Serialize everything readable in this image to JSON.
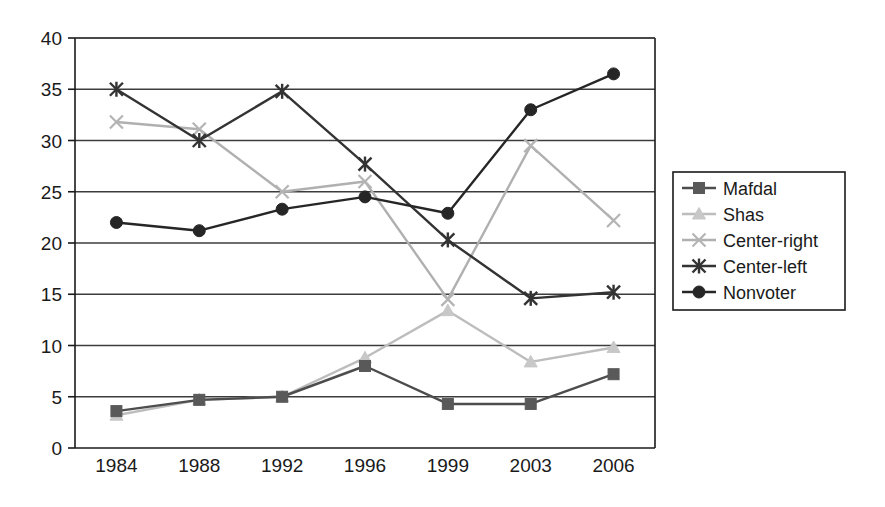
{
  "chart_data": {
    "type": "line",
    "title": "",
    "subtitle": "",
    "xlabel": "",
    "ylabel": "",
    "categories": [
      "1984",
      "1988",
      "1992",
      "1996",
      "1999",
      "2003",
      "2006"
    ],
    "x_tick_labels": [
      "1984",
      "1988",
      "1992",
      "1996",
      "1999",
      "2003",
      "2006"
    ],
    "y_tick_labels": [
      "0",
      "5",
      "10",
      "15",
      "20",
      "25",
      "30",
      "35",
      "40"
    ],
    "y_ticks": [
      0,
      5,
      10,
      15,
      20,
      25,
      30,
      35,
      40
    ],
    "ylim": [
      0,
      40
    ],
    "grid": "horizontal",
    "legend_position": "right",
    "series": [
      {
        "name": "Mafdal",
        "marker": "square",
        "color": "#595959",
        "line_color": "#4d4d4d",
        "values": [
          3.6,
          4.7,
          5.0,
          8.0,
          4.3,
          4.3,
          7.2
        ]
      },
      {
        "name": "Shas",
        "marker": "triangle",
        "color": "#c8c8c8",
        "line_color": "#bdbdbd",
        "values": [
          3.2,
          4.7,
          5.0,
          8.8,
          13.4,
          8.4,
          9.8
        ]
      },
      {
        "name": "Center-right",
        "marker": "cross",
        "color": "#b4b4b4",
        "line_color": "#b0b0b0",
        "values": [
          31.8,
          31.1,
          25.0,
          26.0,
          14.5,
          29.5,
          22.2
        ]
      },
      {
        "name": "Center-left",
        "marker": "asterisk",
        "color": "#333333",
        "line_color": "#333333",
        "values": [
          35.0,
          30.0,
          34.8,
          27.7,
          20.3,
          14.6,
          15.2
        ]
      },
      {
        "name": "Nonvoter",
        "marker": "circle",
        "color": "#262626",
        "line_color": "#262626",
        "values": [
          22.0,
          21.2,
          23.3,
          24.5,
          22.9,
          33.0,
          36.5
        ]
      }
    ]
  },
  "legend": {
    "entries": [
      {
        "label": "Mafdal"
      },
      {
        "label": "Shas"
      },
      {
        "label": "Center-right"
      },
      {
        "label": "Center-left"
      },
      {
        "label": "Nonvoter"
      }
    ]
  },
  "colors": {
    "axis": "#1a1a1a",
    "grid": "#3c3c3c",
    "background": "#ffffff"
  }
}
